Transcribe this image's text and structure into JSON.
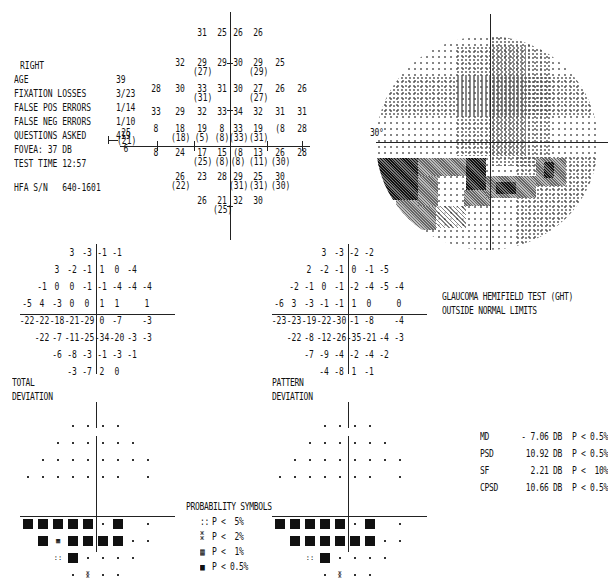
{
  "patient": {
    "eye": "RIGHT",
    "rows": [
      {
        "label": "AGE",
        "value": "39"
      },
      {
        "label": "FIXATION LOSSES",
        "value": "3/23"
      },
      {
        "label": "FALSE POS ERRORS",
        "value": "1/14"
      },
      {
        "label": "FALSE NEG ERRORS",
        "value": "1/10"
      },
      {
        "label": "QUESTIONS ASKED",
        "value": "419"
      },
      {
        "label": "FOVEA:",
        "value": "37 DB"
      },
      {
        "label": "TEST TIME",
        "value": "12:57"
      }
    ],
    "serial_label": "HFA S/N",
    "serial_value": "640-1601"
  },
  "threshold_map": {
    "blind_spot": {
      "top": "25",
      "mid": "(21)",
      "bot": "6"
    },
    "rows": [
      [
        {
          "x": 202,
          "v": "31"
        },
        {
          "x": 222,
          "v": "25"
        },
        {
          "x": 238,
          "v": "26"
        },
        {
          "x": 258,
          "v": "26"
        }
      ],
      [
        {
          "x": 180,
          "v": "32"
        },
        {
          "x": 202,
          "v": "29",
          "s": "(27)"
        },
        {
          "x": 222,
          "v": "29"
        },
        {
          "x": 238,
          "v": "30"
        },
        {
          "x": 258,
          "v": "29",
          "s": "(29)"
        },
        {
          "x": 280,
          "v": "25"
        }
      ],
      [
        {
          "x": 156,
          "v": "28"
        },
        {
          "x": 180,
          "v": "30"
        },
        {
          "x": 202,
          "v": "33",
          "s": "(31)"
        },
        {
          "x": 222,
          "v": "31"
        },
        {
          "x": 238,
          "v": "30"
        },
        {
          "x": 258,
          "v": "27",
          "s": "(27)"
        },
        {
          "x": 280,
          "v": "26"
        },
        {
          "x": 302,
          "v": "26"
        }
      ],
      [
        {
          "x": 156,
          "v": "33"
        },
        {
          "x": 180,
          "v": "29"
        },
        {
          "x": 202,
          "v": "32"
        },
        {
          "x": 222,
          "v": "33"
        },
        {
          "x": 238,
          "v": "34"
        },
        {
          "x": 258,
          "v": "32"
        },
        {
          "x": 280,
          "v": "31"
        },
        {
          "x": 302,
          "v": "31"
        }
      ],
      [
        {
          "x": 156,
          "v": "8"
        },
        {
          "x": 180,
          "v": "18",
          "s": "(18)"
        },
        {
          "x": 202,
          "v": "19",
          "s": "(5)"
        },
        {
          "x": 222,
          "v": "8",
          "s": "(8)"
        },
        {
          "x": 238,
          "v": "33",
          "s": "(33)"
        },
        {
          "x": 258,
          "v": "19",
          "s": "(31)"
        },
        {
          "x": 280,
          "v": "(8"
        },
        {
          "x": 302,
          "v": "28"
        }
      ],
      [
        {
          "x": 156,
          "v": "8"
        },
        {
          "x": 180,
          "v": "24"
        },
        {
          "x": 202,
          "v": "17",
          "s": "(25)"
        },
        {
          "x": 222,
          "v": "15",
          "s": "(8)"
        },
        {
          "x": 238,
          "v": "(8",
          "s": "(8)"
        },
        {
          "x": 258,
          "v": "13",
          "s": "(11)"
        },
        {
          "x": 280,
          "v": "26",
          "s": "(30)"
        },
        {
          "x": 302,
          "v": "28"
        }
      ],
      [
        {
          "x": 180,
          "v": "26",
          "s": "(22)"
        },
        {
          "x": 202,
          "v": "23"
        },
        {
          "x": 222,
          "v": "28"
        },
        {
          "x": 238,
          "v": "29",
          "s": "(31)"
        },
        {
          "x": 258,
          "v": "25",
          "s": "(31)"
        },
        {
          "x": 280,
          "v": "30",
          "s": "(30)"
        }
      ],
      [
        {
          "x": 202,
          "v": "26"
        },
        {
          "x": 222,
          "v": "21",
          "s": "(25)"
        },
        {
          "x": 238,
          "v": "32"
        },
        {
          "x": 258,
          "v": "30"
        }
      ]
    ]
  },
  "greyscale": {
    "label": "30°"
  },
  "total_deviation": {
    "title_line1": "TOTAL",
    "title_line2": "DEVIATION",
    "rows": [
      [
        "",
        "",
        "",
        "3",
        "-3",
        "-1",
        "-1",
        "",
        "",
        ""
      ],
      [
        "",
        "",
        "3",
        "-2",
        "-1",
        "1",
        "0",
        "-4",
        "",
        ""
      ],
      [
        "",
        "-1",
        "0",
        "0",
        "-1",
        "-1",
        "-4",
        "-4",
        "-4",
        ""
      ],
      [
        "-5",
        "4",
        "-3",
        "0",
        "0",
        "1",
        "1",
        "",
        "1",
        ""
      ],
      [
        "-22",
        "-22",
        "-18",
        "-21",
        "-29",
        "0",
        "-7",
        "",
        "-3",
        ""
      ],
      [
        "",
        "-22",
        "-7",
        "-11",
        "-25",
        "-34",
        "-20",
        "-3",
        "-3",
        ""
      ],
      [
        "",
        "",
        "-6",
        "-8",
        "-3",
        "-1",
        "-3",
        "-1",
        "",
        ""
      ],
      [
        "",
        "",
        "",
        "-3",
        "-7",
        "2",
        "0",
        "",
        "",
        ""
      ]
    ]
  },
  "pattern_deviation": {
    "title_line1": "PATTERN",
    "title_line2": "DEVIATION",
    "rows": [
      [
        "",
        "",
        "",
        "3",
        "-3",
        "-2",
        "-2",
        "",
        "",
        ""
      ],
      [
        "",
        "",
        "2",
        "-2",
        "-1",
        "0",
        "-1",
        "-5",
        "",
        ""
      ],
      [
        "",
        "-2",
        "-1",
        "0",
        "-1",
        "-2",
        "-4",
        "-5",
        "-4",
        ""
      ],
      [
        "-6",
        "3",
        "-3",
        "-1",
        "-1",
        "1",
        "0",
        "",
        "0",
        ""
      ],
      [
        "-23",
        "-23",
        "-19",
        "-22",
        "-30",
        "-1",
        "-8",
        "",
        "-4",
        ""
      ],
      [
        "",
        "-22",
        "-8",
        "-12",
        "-26",
        "-35",
        "-21",
        "-4",
        "-3",
        ""
      ],
      [
        "",
        "",
        "-7",
        "-9",
        "-4",
        "-2",
        "-4",
        "-2",
        "",
        ""
      ],
      [
        "",
        "",
        "",
        "-4",
        "-8",
        "1",
        "-1",
        "",
        "",
        ""
      ]
    ]
  },
  "ght": {
    "line1": "GLAUCOMA HEMIFIELD TEST (GHT)",
    "line2": "OUTSIDE NORMAL LIMITS"
  },
  "global_indices": [
    {
      "name": "MD",
      "value": "- 7.06 DB",
      "p": "P < 0.5%"
    },
    {
      "name": "PSD",
      "value": "10.92 DB",
      "p": "P < 0.5%"
    },
    {
      "name": "SF",
      "value": "2.21 DB",
      "p": "P <  10%"
    },
    {
      "name": "CPSD",
      "value": "10.66 DB",
      "p": "P < 0.5%"
    }
  ],
  "probability_symbols": {
    "title": "PROBABILITY SYMBOLS",
    "items": [
      {
        "symbol": "::",
        "label": "P <  5%"
      },
      {
        "symbol": "⁑",
        "label": "P <  2%"
      },
      {
        "symbol": "▦",
        "label": "P <  1%"
      },
      {
        "symbol": "■",
        "label": "P < 0.5%"
      }
    ]
  },
  "prob_plot_rows": [
    [
      "",
      "",
      "",
      ".",
      ".",
      ".",
      ".",
      "",
      "",
      ""
    ],
    [
      "",
      "",
      ".",
      ".",
      ".",
      ".",
      ".",
      ".",
      "",
      ""
    ],
    [
      "",
      ".",
      ".",
      ".",
      ".",
      ".",
      ".",
      ".",
      ".",
      ""
    ],
    [
      ".",
      ".",
      ".",
      ".",
      ".",
      ".",
      ".",
      "",
      ".",
      ""
    ],
    [
      "B",
      "B",
      "B",
      "B",
      "B",
      ".",
      "B",
      "",
      ".",
      ""
    ],
    [
      "",
      "B",
      "1",
      "B",
      "B",
      "B",
      "B",
      ".",
      ".",
      ""
    ],
    [
      "",
      "",
      "5",
      "B",
      ".",
      ".",
      ".",
      ".",
      "",
      ""
    ],
    [
      "",
      "",
      "",
      ".",
      "2",
      ".",
      ".",
      "",
      "",
      ""
    ]
  ],
  "pattern_prob_rows": [
    [
      "",
      "",
      "",
      ".",
      ".",
      ".",
      ".",
      "",
      "",
      ""
    ],
    [
      "",
      "",
      ".",
      ".",
      ".",
      ".",
      ".",
      ".",
      "",
      ""
    ],
    [
      "",
      ".",
      ".",
      ".",
      ".",
      ".",
      ".",
      ".",
      ".",
      ""
    ],
    [
      ".",
      ".",
      ".",
      ".",
      ".",
      ".",
      ".",
      "",
      ".",
      ""
    ],
    [
      "B",
      "B",
      "B",
      "B",
      "B",
      ".",
      "B",
      "",
      ".",
      ""
    ],
    [
      "",
      "B",
      "B",
      "B",
      "B",
      "B",
      "B",
      ".",
      ".",
      ""
    ],
    [
      "",
      "",
      "5",
      "B",
      ".",
      ".",
      ".",
      ".",
      "",
      ""
    ],
    [
      "",
      "",
      "",
      ".",
      "2",
      ".",
      ".",
      "",
      "",
      ""
    ]
  ]
}
